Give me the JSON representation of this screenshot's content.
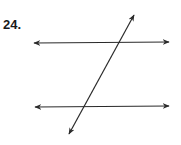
{
  "problem": {
    "number_label": "24."
  },
  "diagram": {
    "stroke_color": "#2a2a2a",
    "lines": [
      {
        "name": "parallel-line-top",
        "x1": 34,
        "y1": 43,
        "x2": 169,
        "y2": 42
      },
      {
        "name": "parallel-line-bottom",
        "x1": 35,
        "y1": 107,
        "x2": 169,
        "y2": 106
      },
      {
        "name": "transversal",
        "x1": 134,
        "y1": 15,
        "x2": 69,
        "y2": 134
      }
    ]
  }
}
